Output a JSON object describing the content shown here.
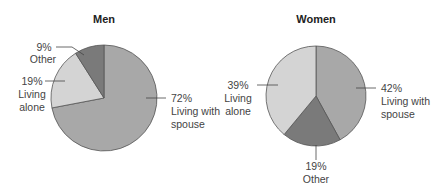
{
  "chart_data": [
    {
      "type": "pie",
      "title": "Men",
      "categories": [
        "Living with spouse",
        "Living alone",
        "Other"
      ],
      "values": [
        72,
        19,
        9
      ],
      "labels": [
        {
          "pct": "72%",
          "lines": [
            "Living with",
            "spouse"
          ]
        },
        {
          "pct": "19%",
          "lines": [
            "Living",
            "alone"
          ]
        },
        {
          "pct": "9%",
          "lines": [
            "Other"
          ]
        }
      ],
      "colors": [
        "#a8a8a8",
        "#d4d4d4",
        "#7a7a7a"
      ]
    },
    {
      "type": "pie",
      "title": "Women",
      "categories": [
        "Living with spouse",
        "Other",
        "Living alone"
      ],
      "values": [
        42,
        19,
        39
      ],
      "labels": [
        {
          "pct": "42%",
          "lines": [
            "Living with",
            "spouse"
          ]
        },
        {
          "pct": "19%",
          "lines": [
            "Other"
          ]
        },
        {
          "pct": "39%",
          "lines": [
            "Living",
            "alone"
          ]
        }
      ],
      "colors": [
        "#a8a8a8",
        "#7a7a7a",
        "#d4d4d4"
      ]
    }
  ]
}
